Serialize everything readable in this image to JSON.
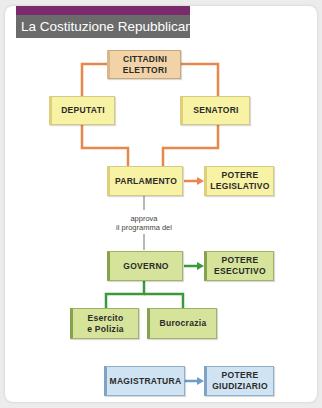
{
  "title": "La Costituzione Repubblicana",
  "colors": {
    "title_accent": "#7b2a6b",
    "title_bg": "#6b6b6b",
    "orange_line": "#e8874a",
    "green_line": "#3a9a3a",
    "blue_line": "#6f9cc8",
    "gray_line": "#b8b8b8"
  },
  "nodes": {
    "cittadini": [
      "CITTADINI",
      "ELETTORI"
    ],
    "deputati": "DEPUTATI",
    "senatori": "SENATORI",
    "parlamento": "PARLAMENTO",
    "potere_legislativo": [
      "POTERE",
      "LEGISLATIVO"
    ],
    "governo": "GOVERNO",
    "potere_esecutivo": [
      "POTERE",
      "ESECUTIVO"
    ],
    "esercito": [
      "Esercito",
      "e Polizia"
    ],
    "burocrazia": "Burocrazia",
    "magistratura": "MAGISTRATURA",
    "potere_giudiziario": [
      "POTERE",
      "GIUDIZIARIO"
    ]
  },
  "edge_label": [
    "approva",
    "il programma del"
  ]
}
